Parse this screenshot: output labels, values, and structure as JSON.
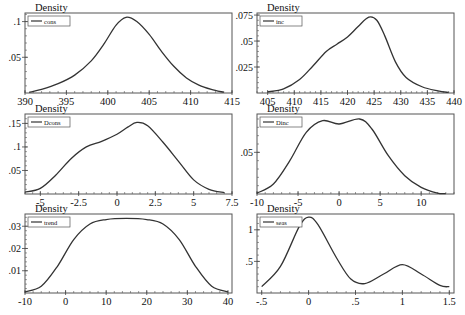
{
  "chart_data": [
    {
      "type": "line",
      "title": "",
      "ylabel": "Density",
      "xlabel": "",
      "legend": [
        "cons"
      ],
      "legend_position": "top-left",
      "grid": false,
      "xlim": [
        390,
        415
      ],
      "ylim": [
        0,
        0.112
      ],
      "xticks": [
        390,
        395,
        400,
        405,
        410,
        415
      ],
      "xtick_labels": [
        "390",
        "395",
        "400",
        "405",
        "410",
        "415"
      ],
      "yticks": [
        0.05,
        0.1
      ],
      "ytick_labels": [
        ".05",
        ".1"
      ],
      "x": [
        390.5,
        392,
        394,
        396,
        398,
        399.5,
        401,
        402.2,
        403.5,
        405,
        406.5,
        408,
        409.5,
        411,
        412.5,
        414
      ],
      "y": [
        0.001,
        0.005,
        0.013,
        0.025,
        0.045,
        0.068,
        0.095,
        0.106,
        0.1,
        0.082,
        0.058,
        0.037,
        0.021,
        0.011,
        0.005,
        0.001
      ]
    },
    {
      "type": "line",
      "title": "",
      "ylabel": "Density",
      "xlabel": "",
      "legend": [
        "inc"
      ],
      "legend_position": "top-left",
      "grid": false,
      "xlim": [
        403,
        440
      ],
      "ylim": [
        0,
        0.077
      ],
      "xticks": [
        405,
        410,
        415,
        420,
        425,
        430,
        435,
        440
      ],
      "xtick_labels": [
        "405",
        "410",
        "415",
        "420",
        "425",
        "430",
        "435",
        "440"
      ],
      "yticks": [
        0.025,
        0.05,
        0.075
      ],
      "ytick_labels": [
        ".025",
        ".05",
        ".075"
      ],
      "x": [
        405,
        408,
        411,
        413.5,
        416,
        418,
        420,
        422,
        424,
        425.5,
        427,
        429,
        431,
        434,
        437,
        439
      ],
      "y": [
        0.001,
        0.004,
        0.013,
        0.026,
        0.04,
        0.047,
        0.054,
        0.064,
        0.073,
        0.07,
        0.055,
        0.03,
        0.015,
        0.006,
        0.002,
        0.0005
      ]
    },
    {
      "type": "line",
      "title": "",
      "ylabel": "Density",
      "xlabel": "",
      "legend": [
        "Dcons"
      ],
      "legend_position": "top-left",
      "grid": false,
      "xlim": [
        -6,
        7.5
      ],
      "ylim": [
        0,
        0.17
      ],
      "xticks": [
        -5,
        -2.5,
        0,
        2.5,
        5,
        7.5
      ],
      "xtick_labels": [
        "-5",
        "-2.5",
        "0",
        "2.5",
        "5",
        "7.5"
      ],
      "yticks": [
        0.05,
        0.1,
        0.15
      ],
      "ytick_labels": [
        ".05",
        ".1",
        ".15"
      ],
      "x": [
        -6,
        -5,
        -4,
        -3,
        -2,
        -1,
        0,
        0.7,
        1.3,
        2,
        3,
        4,
        5,
        6,
        7
      ],
      "y": [
        0.004,
        0.012,
        0.04,
        0.075,
        0.1,
        0.112,
        0.127,
        0.142,
        0.152,
        0.145,
        0.11,
        0.07,
        0.03,
        0.01,
        0.003
      ]
    },
    {
      "type": "line",
      "title": "",
      "ylabel": "Density",
      "xlabel": "",
      "legend": [
        "Dinc"
      ],
      "legend_position": "top-left",
      "grid": false,
      "xlim": [
        -10,
        14
      ],
      "ylim": [
        0,
        0.096
      ],
      "xticks": [
        -10,
        -5,
        0,
        5,
        10
      ],
      "xtick_labels": [
        "-10",
        "-5",
        "0",
        "5",
        "10"
      ],
      "yticks": [
        0.05
      ],
      "ytick_labels": [
        ".05"
      ],
      "x": [
        -10,
        -8,
        -6,
        -4,
        -2,
        0,
        2.5,
        4,
        6,
        8,
        10,
        12,
        13
      ],
      "y": [
        0.001,
        0.012,
        0.04,
        0.074,
        0.088,
        0.084,
        0.09,
        0.078,
        0.046,
        0.022,
        0.008,
        0.001,
        0.0005
      ],
      "note": "bimodal, peaks near -2 and 2.5, dip near 0"
    },
    {
      "type": "line",
      "title": "",
      "ylabel": "Density",
      "xlabel": "",
      "legend": [
        "trend"
      ],
      "legend_position": "top-left",
      "grid": false,
      "xlim": [
        -10,
        41
      ],
      "ylim": [
        0,
        0.0355
      ],
      "xticks": [
        -10,
        0,
        10,
        20,
        30,
        40
      ],
      "xtick_labels": [
        "-10",
        "0",
        "10",
        "20",
        "30",
        "40"
      ],
      "yticks": [
        0.01,
        0.02,
        0.03
      ],
      "ytick_labels": [
        ".01",
        ".02",
        ".03"
      ],
      "x": [
        -10,
        -6,
        -2,
        2,
        6,
        10,
        15,
        20,
        24,
        28,
        32,
        36,
        40
      ],
      "y": [
        0.0005,
        0.003,
        0.012,
        0.024,
        0.031,
        0.033,
        0.0335,
        0.033,
        0.031,
        0.024,
        0.012,
        0.003,
        0.0005
      ]
    },
    {
      "type": "line",
      "title": "",
      "ylabel": "Density",
      "xlabel": "",
      "legend": [
        "seas"
      ],
      "legend_position": "top-left",
      "grid": false,
      "xlim": [
        -0.55,
        1.55
      ],
      "ylim": [
        0,
        1.25
      ],
      "xticks": [
        -0.5,
        0,
        0.5,
        1,
        1.5
      ],
      "xtick_labels": [
        "-.5",
        "0",
        ".5",
        "1",
        "1.5"
      ],
      "yticks": [
        0.5,
        1
      ],
      "ytick_labels": [
        ".5",
        "1"
      ],
      "x": [
        -0.5,
        -0.3,
        -0.1,
        0,
        0.1,
        0.3,
        0.45,
        0.6,
        0.8,
        1.0,
        1.2,
        1.4,
        1.5
      ],
      "y": [
        0.1,
        0.42,
        1.05,
        1.2,
        1.08,
        0.55,
        0.22,
        0.15,
        0.3,
        0.45,
        0.3,
        0.12,
        0.1
      ]
    }
  ],
  "panels": [
    {
      "ylabel": "Density",
      "legend_label": "cons"
    },
    {
      "ylabel": "Density",
      "legend_label": "inc"
    },
    {
      "ylabel": "Density",
      "legend_label": "Dcons"
    },
    {
      "ylabel": "Density",
      "legend_label": "Dinc"
    },
    {
      "ylabel": "Density",
      "legend_label": "trend"
    },
    {
      "ylabel": "Density",
      "legend_label": "seas"
    }
  ]
}
